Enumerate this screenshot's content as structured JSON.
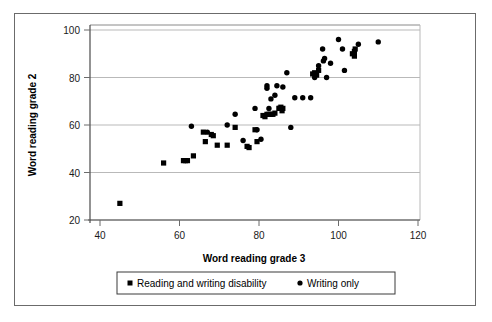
{
  "chart_data": {
    "type": "scatter",
    "title": "",
    "xlabel": "Word reading grade 3",
    "ylabel": "Word reading grade 2",
    "xlim": [
      36,
      122
    ],
    "ylim": [
      19,
      102
    ],
    "xticks": [
      40,
      60,
      80,
      100,
      120
    ],
    "yticks": [
      20,
      40,
      60,
      80,
      100
    ],
    "xtick_labels": [
      "40",
      "60",
      "80",
      "100",
      "120"
    ],
    "ytick_labels": [
      "20",
      "40",
      "60",
      "80",
      "100"
    ],
    "grid": "horizontal",
    "legend_position": "bottom",
    "series": [
      {
        "name": "Reading and writing disability",
        "marker": "square",
        "color": "#000000",
        "points": [
          [
            45,
            27
          ],
          [
            56,
            44
          ],
          [
            61,
            45
          ],
          [
            61.5,
            45
          ],
          [
            62,
            45
          ],
          [
            63.5,
            47
          ],
          [
            66,
            57
          ],
          [
            66.5,
            53
          ],
          [
            68,
            56
          ],
          [
            68.5,
            55.5
          ],
          [
            69.5,
            51.5
          ],
          [
            72,
            51.5
          ],
          [
            74,
            59
          ],
          [
            77,
            51
          ],
          [
            77.5,
            50.5
          ],
          [
            79,
            58
          ],
          [
            79.5,
            53
          ],
          [
            81,
            64
          ],
          [
            81.5,
            63.5
          ],
          [
            82,
            64.5
          ],
          [
            82.5,
            64.5
          ],
          [
            83,
            64.5
          ],
          [
            83.5,
            64.5
          ],
          [
            84,
            65
          ],
          [
            85,
            67
          ],
          [
            85.2,
            67
          ],
          [
            85.5,
            67.5
          ],
          [
            85.8,
            66
          ],
          [
            86,
            67
          ],
          [
            93.5,
            81.5
          ],
          [
            94,
            82
          ],
          [
            94.5,
            81
          ],
          [
            95,
            83
          ],
          [
            103.5,
            90
          ],
          [
            104,
            91
          ],
          [
            104.2,
            92
          ],
          [
            104,
            89
          ]
        ]
      },
      {
        "name": "Writing only",
        "marker": "circle",
        "color": "#000000",
        "points": [
          [
            63,
            59.5
          ],
          [
            67,
            57
          ],
          [
            72,
            60
          ],
          [
            74,
            64.5
          ],
          [
            76,
            53.5
          ],
          [
            79,
            67
          ],
          [
            79.5,
            58
          ],
          [
            80.5,
            54
          ],
          [
            82,
            76.5
          ],
          [
            82,
            75.5
          ],
          [
            82.5,
            67
          ],
          [
            83,
            71
          ],
          [
            84,
            72.5
          ],
          [
            84.5,
            76.5
          ],
          [
            86,
            76
          ],
          [
            87,
            82
          ],
          [
            88,
            59
          ],
          [
            89,
            71.5
          ],
          [
            91,
            71.5
          ],
          [
            93,
            71.5
          ],
          [
            94,
            80
          ],
          [
            95,
            85
          ],
          [
            96,
            92
          ],
          [
            96.5,
            88
          ],
          [
            96.2,
            87
          ],
          [
            97,
            80
          ],
          [
            98,
            86
          ],
          [
            100,
            96
          ],
          [
            101,
            92
          ],
          [
            101.5,
            83
          ],
          [
            105,
            94
          ],
          [
            110,
            95
          ]
        ]
      }
    ]
  },
  "legend": {
    "items": [
      {
        "label": "Reading and writing disability",
        "marker": "square"
      },
      {
        "label": "Writing only",
        "marker": "circle"
      }
    ]
  }
}
